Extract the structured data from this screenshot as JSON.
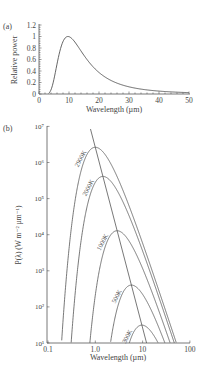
{
  "chart_data": [
    {
      "panel": "(a)",
      "type": "line",
      "title": "",
      "xlabel": "Wavelength (µm)",
      "ylabel": "Relative power",
      "xlim": [
        0,
        50
      ],
      "ylim": [
        0,
        1.2
      ],
      "xticks": [
        "0",
        "10",
        "20",
        "30",
        "40",
        "50"
      ],
      "yticks": [
        "0",
        "0.2",
        "0.4",
        "0.6",
        "0.8",
        "1",
        "1.2"
      ],
      "series": [
        {
          "name": "Relative power (300 K blackbody)",
          "x": [
            3,
            4,
            5,
            6,
            7,
            8,
            9,
            10,
            11,
            12,
            14,
            16,
            18,
            20,
            25,
            30,
            35,
            40,
            45,
            50
          ],
          "y": [
            0.0,
            0.06,
            0.28,
            0.58,
            0.82,
            0.95,
            1.0,
            0.99,
            0.95,
            0.89,
            0.76,
            0.62,
            0.5,
            0.4,
            0.24,
            0.14,
            0.09,
            0.06,
            0.04,
            0.03
          ]
        }
      ]
    },
    {
      "panel": "(b)",
      "type": "line",
      "title": "",
      "xlabel": "Wavelength (µm)",
      "ylabel": "P(λ) (W m⁻² µm⁻¹)",
      "xscale": "log",
      "yscale": "log",
      "xlim": [
        0.1,
        100
      ],
      "ylim": [
        10,
        10000000
      ],
      "xticks": [
        "0.1",
        "1.0",
        "10",
        "100"
      ],
      "yticks": [
        "10¹",
        "10²",
        "10³",
        "10⁴",
        "10⁵",
        "10⁶",
        "10⁷"
      ],
      "series": [
        {
          "name": "2900K",
          "temperature": 2900
        },
        {
          "name": "2000K",
          "temperature": 2000
        },
        {
          "name": "1000K",
          "temperature": 1000
        },
        {
          "name": "500K",
          "temperature": 500
        },
        {
          "name": "300K",
          "temperature": 300
        }
      ],
      "annotation": "Wien displacement line through curve peaks"
    }
  ],
  "panel_labels": {
    "a": "(a)",
    "b": "(b)"
  },
  "colors": {
    "line": "#555555",
    "axis": "#555555",
    "text": "#444444"
  }
}
